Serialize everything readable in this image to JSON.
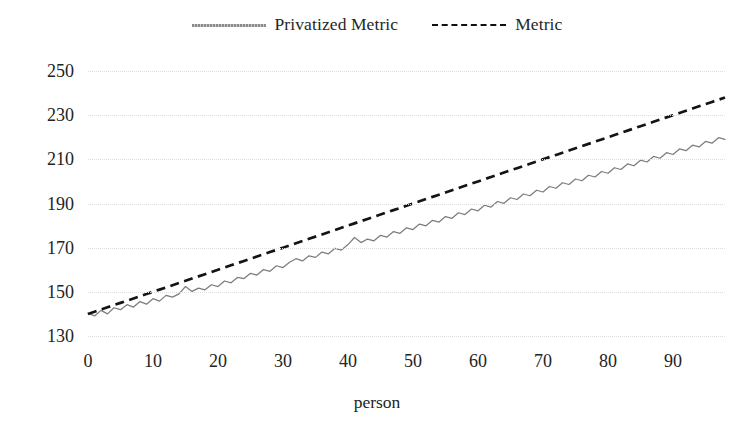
{
  "chart_data": {
    "type": "line",
    "title": "",
    "xlabel": "person",
    "ylabel": "",
    "xlim": [
      0,
      98
    ],
    "ylim": [
      130,
      250
    ],
    "grid": true,
    "grid_axis": "y",
    "legend_position": "top-center",
    "xticks": [
      0,
      10,
      20,
      30,
      40,
      50,
      60,
      70,
      80,
      90
    ],
    "yticks": [
      130,
      150,
      170,
      190,
      210,
      230,
      250
    ],
    "x": [
      0,
      1,
      2,
      3,
      4,
      5,
      6,
      7,
      8,
      9,
      10,
      11,
      12,
      13,
      14,
      15,
      16,
      17,
      18,
      19,
      20,
      21,
      22,
      23,
      24,
      25,
      26,
      27,
      28,
      29,
      30,
      31,
      32,
      33,
      34,
      35,
      36,
      37,
      38,
      39,
      40,
      41,
      42,
      43,
      44,
      45,
      46,
      47,
      48,
      49,
      50,
      51,
      52,
      53,
      54,
      55,
      56,
      57,
      58,
      59,
      60,
      61,
      62,
      63,
      64,
      65,
      66,
      67,
      68,
      69,
      70,
      71,
      72,
      73,
      74,
      75,
      76,
      77,
      78,
      79,
      80,
      81,
      82,
      83,
      84,
      85,
      86,
      87,
      88,
      89,
      90,
      91,
      92,
      93,
      94,
      95,
      96,
      97,
      98
    ],
    "series": [
      {
        "name": "Privatized Metric",
        "color": "#7d7d7d",
        "style": "solid-noisy",
        "values": [
          140.3,
          139.1,
          141.6,
          140.0,
          142.8,
          141.9,
          144.2,
          143.1,
          145.6,
          144.4,
          146.9,
          145.8,
          148.4,
          147.6,
          149.1,
          152.4,
          150.2,
          151.7,
          150.9,
          153.2,
          152.4,
          154.9,
          154.1,
          156.5,
          156.0,
          158.4,
          157.6,
          160.1,
          159.3,
          161.8,
          161.0,
          163.4,
          165.0,
          164.0,
          166.3,
          165.6,
          168.0,
          167.2,
          169.7,
          168.9,
          171.4,
          174.6,
          172.3,
          173.9,
          173.1,
          175.6,
          174.8,
          177.3,
          176.5,
          179.0,
          178.2,
          180.7,
          179.9,
          182.4,
          181.6,
          184.1,
          183.3,
          185.8,
          185.0,
          187.5,
          186.7,
          189.2,
          188.4,
          190.9,
          190.1,
          192.6,
          191.8,
          194.3,
          193.5,
          196.0,
          195.2,
          197.7,
          196.9,
          199.4,
          198.6,
          201.1,
          200.3,
          202.8,
          202.0,
          204.5,
          203.7,
          206.2,
          205.4,
          207.9,
          207.1,
          209.6,
          208.8,
          211.3,
          210.5,
          213.0,
          212.2,
          214.7,
          213.9,
          216.4,
          215.6,
          218.1,
          217.3,
          219.8,
          219.0
        ]
      },
      {
        "name": "Metric",
        "color": "#141414",
        "style": "dashed",
        "values": [
          140.0,
          141.0,
          142.0,
          143.0,
          144.0,
          145.0,
          146.0,
          147.0,
          148.0,
          149.0,
          150.0,
          151.0,
          152.0,
          153.0,
          154.0,
          155.0,
          156.0,
          157.0,
          158.0,
          159.0,
          160.0,
          161.0,
          162.0,
          163.0,
          164.0,
          165.0,
          166.0,
          167.0,
          168.0,
          169.0,
          170.0,
          171.0,
          172.0,
          173.0,
          174.0,
          175.0,
          176.0,
          177.0,
          178.0,
          179.0,
          180.0,
          181.0,
          182.0,
          183.0,
          184.0,
          185.0,
          186.0,
          187.0,
          188.0,
          189.0,
          190.0,
          191.0,
          192.0,
          193.0,
          194.0,
          195.0,
          196.0,
          197.0,
          198.0,
          199.0,
          200.0,
          201.0,
          202.0,
          203.0,
          204.0,
          205.0,
          206.0,
          207.0,
          208.0,
          209.0,
          210.0,
          211.0,
          212.0,
          213.0,
          214.0,
          215.0,
          216.0,
          217.0,
          218.0,
          219.0,
          220.0,
          221.0,
          222.0,
          223.0,
          224.0,
          225.0,
          226.0,
          227.0,
          228.0,
          229.0,
          230.0,
          231.0,
          232.0,
          233.0,
          234.0,
          235.0,
          236.0,
          237.0,
          238.0
        ]
      }
    ]
  },
  "legend": {
    "entries": [
      {
        "label": "Privatized Metric",
        "icon": "solid-line-swatch"
      },
      {
        "label": "Metric",
        "icon": "dashed-line-swatch"
      }
    ]
  }
}
